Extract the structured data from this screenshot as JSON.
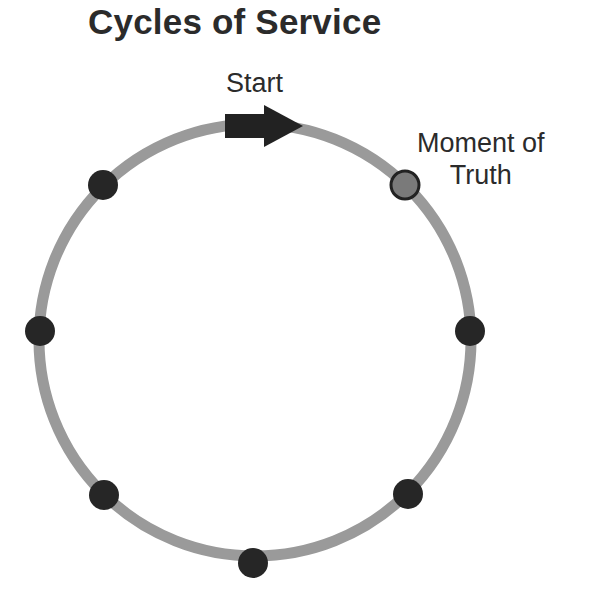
{
  "title": "Cycles of Service",
  "labels": {
    "start": "Start",
    "moment_of_truth_line1": "Moment of",
    "moment_of_truth_line2": "Truth"
  },
  "colors": {
    "ring": "#9a9a9a",
    "dot": "#262626",
    "moment_of_truth_fill": "#7a7a7a",
    "moment_of_truth_stroke": "#222222",
    "arrow": "#222222",
    "text": "#2b2b2b"
  },
  "diagram": {
    "type": "cycle",
    "ring": {
      "cx": 255,
      "cy": 340,
      "r": 216,
      "stroke_width": 11
    },
    "start_arrow": {
      "direction": "clockwise",
      "position": "top"
    },
    "touchpoints": [
      {
        "id": "top-left",
        "cx": 103,
        "cy": 185
      },
      {
        "id": "left",
        "cx": 40,
        "cy": 331
      },
      {
        "id": "bottom-left",
        "cx": 104,
        "cy": 495
      },
      {
        "id": "bottom",
        "cx": 253,
        "cy": 563
      },
      {
        "id": "bottom-right",
        "cx": 408,
        "cy": 494
      },
      {
        "id": "right",
        "cx": 470,
        "cy": 331
      }
    ],
    "moment_of_truth": {
      "cx": 405,
      "cy": 185
    }
  }
}
